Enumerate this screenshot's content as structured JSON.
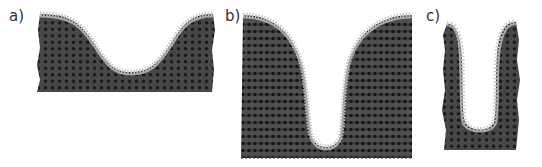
{
  "figure": {
    "panels": [
      {
        "id": "a",
        "label": "a)",
        "description": "shallow U-shaped tissue fold"
      },
      {
        "id": "b",
        "label": "b)",
        "description": "deep narrow U-shaped invagination"
      },
      {
        "id": "c",
        "label": "c)",
        "description": "tall narrow U-shaped fold with thin walls"
      }
    ]
  },
  "colors": {
    "tissue_fill": "#4a4a4a",
    "cell_nucleus": "#1e1e1e",
    "surface_layer": "#a8a8a8",
    "surface_fringe": "#c8c8c8",
    "label_text": "#333333",
    "background": "#ffffff"
  }
}
